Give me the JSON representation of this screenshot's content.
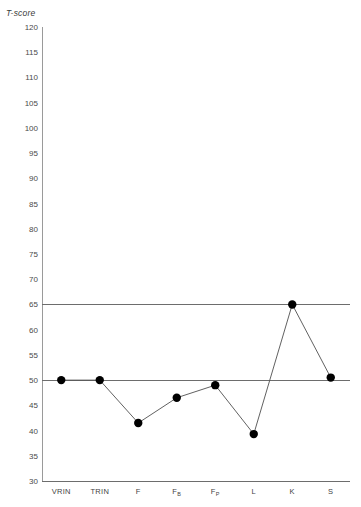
{
  "chart_data": {
    "type": "line",
    "title": "",
    "subtitle": "",
    "xlabel": "",
    "ylabel": "T-score",
    "ylim": [
      30,
      120
    ],
    "ytick_step": 5,
    "yticks": [
      120,
      115,
      110,
      105,
      100,
      95,
      90,
      85,
      80,
      75,
      70,
      65,
      60,
      55,
      50,
      45,
      40,
      35,
      30
    ],
    "grid": false,
    "legend": "none",
    "categories": [
      "VRIN",
      "TRIN",
      "F",
      "FB",
      "FP",
      "L",
      "K",
      "S"
    ],
    "category_labels": [
      "VRIN",
      "TRIN",
      "F",
      "F",
      "F",
      "L",
      "K",
      "S"
    ],
    "category_subscripts": [
      "",
      "",
      "",
      "B",
      "P",
      "",
      "",
      ""
    ],
    "values": [
      50,
      50,
      41.5,
      46.5,
      49,
      39.3,
      65,
      50.5
    ],
    "series": [
      {
        "name": "T-score",
        "values": [
          50,
          50,
          41.5,
          46.5,
          49,
          39.3,
          65,
          50.5
        ]
      }
    ],
    "reference_lines": [
      {
        "name": "clinical-elevation-line",
        "value": 65
      },
      {
        "name": "mean-line",
        "value": 50
      }
    ],
    "marker": "filled-circle",
    "marker_color": "#000000",
    "line_color": "#4f4f4f",
    "axis_color": "#6d6d6d"
  }
}
